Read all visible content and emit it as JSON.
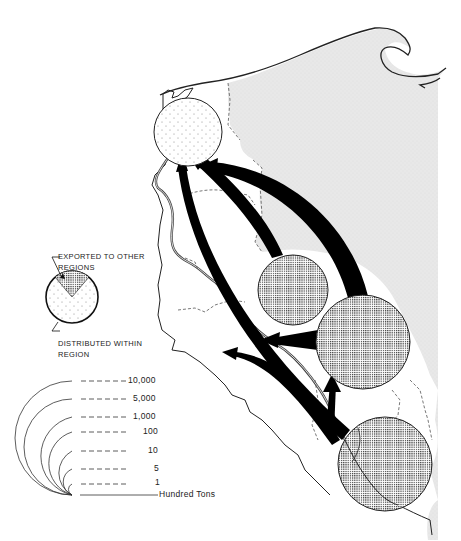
{
  "legend": {
    "pie_key": {
      "exported_label_line1": "EXPORTED TO OTHER",
      "exported_label_line2": "REGIONS",
      "distributed_label_line1": "DISTRIBUTED  WITHIN",
      "distributed_label_line2": "REGION"
    },
    "scale": {
      "unit_label": "Hundred Tons",
      "values": [
        "10,000",
        "5,000",
        "1,000",
        "100",
        "10",
        "5",
        "1"
      ]
    }
  },
  "colors": {
    "land_shaded": "#e6e6e6",
    "outline": "#222222",
    "arrow": "#000000",
    "exported_fill": "#8a8a8a",
    "distributed_fill": "#ffffff"
  },
  "map": {
    "circles": [
      {
        "id": "north-region",
        "cx": 188,
        "cy": 132,
        "r": 34,
        "type": "distributed"
      },
      {
        "id": "center-region",
        "cx": 293,
        "cy": 290,
        "r": 35,
        "type": "exported"
      },
      {
        "id": "east-region",
        "cx": 363,
        "cy": 342,
        "r": 47,
        "type": "exported"
      },
      {
        "id": "south-region",
        "cx": 385,
        "cy": 464,
        "r": 47,
        "type": "exported"
      }
    ],
    "flows": [
      {
        "from": "center-region",
        "to": "north-region"
      },
      {
        "from": "east-region",
        "to": "north-region"
      },
      {
        "from": "south-region",
        "to": "north-region"
      },
      {
        "from": "east-region",
        "to": "west"
      },
      {
        "from": "south-region",
        "to": "west-coast"
      },
      {
        "from": "south-region",
        "to": "east-region"
      }
    ]
  }
}
